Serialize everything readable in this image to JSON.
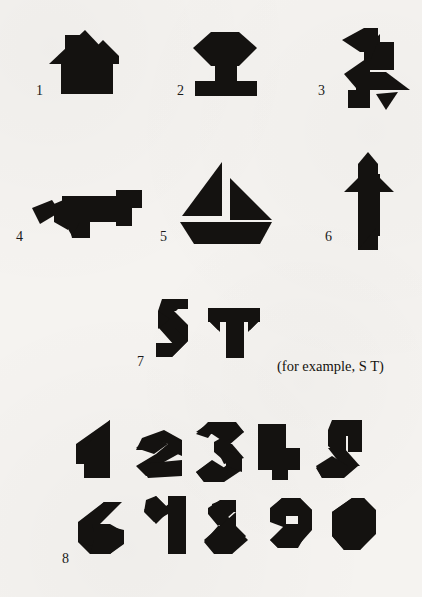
{
  "page": {
    "background_color": "#f5f3f0",
    "ink_color": "#141210",
    "type": "tangram-puzzle-figure-sheet"
  },
  "figures": [
    {
      "number": "1",
      "name": "house",
      "row": 1
    },
    {
      "number": "2",
      "name": "pedestal",
      "row": 1
    },
    {
      "number": "3",
      "name": "bird",
      "row": 1
    },
    {
      "number": "4",
      "name": "fox",
      "row": 2
    },
    {
      "number": "5",
      "name": "sailboat",
      "row": 2
    },
    {
      "number": "6",
      "name": "rocket",
      "row": 2
    },
    {
      "number": "7",
      "name": "letters",
      "row": 3
    },
    {
      "number": "8",
      "name": "digits",
      "row": 4
    }
  ],
  "labels": {
    "one": "1",
    "two": "2",
    "three": "3",
    "four": "4",
    "five": "5",
    "six": "6",
    "seven": "7",
    "eight": "8"
  },
  "caption": {
    "example_note": "(for example, S T)"
  },
  "letters": {
    "glyphs": [
      "S",
      "T"
    ]
  },
  "digits": {
    "row_top": [
      "1",
      "2",
      "3",
      "4",
      "5"
    ],
    "row_bottom": [
      "6",
      "7",
      "8",
      "9",
      "0"
    ]
  }
}
